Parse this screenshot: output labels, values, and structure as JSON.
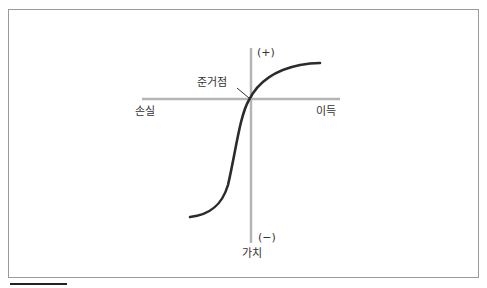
{
  "diagram": {
    "type": "prospect-theory-value-function",
    "labels": {
      "plus": "(+)",
      "minus": "(−)",
      "reference_point": "준거점",
      "loss": "손실",
      "gain": "이득",
      "value": "가치"
    },
    "colors": {
      "axis": "#b5b5b5",
      "curve": "#2b2b2b",
      "frame": "#9a9a9a",
      "text": "#333333"
    }
  }
}
